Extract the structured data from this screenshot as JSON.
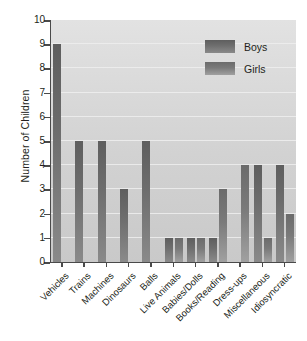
{
  "chart_data": {
    "type": "bar",
    "title": "",
    "xlabel": "",
    "ylabel": "Number of Children",
    "ylim": [
      0,
      10
    ],
    "yticks": [
      0,
      1,
      2,
      3,
      4,
      5,
      6,
      7,
      8,
      9,
      10
    ],
    "grid": true,
    "legend_position": "top-right",
    "categories": [
      "Vehicles",
      "Trains",
      "Machines",
      "Dinosaurs",
      "Balls",
      "Live Animals",
      "Babies/Dolls",
      "Books/Reading",
      "Dress-ups",
      "Miscellaneous",
      "Idiosyncratic"
    ],
    "series": [
      {
        "name": "Boys",
        "values": [
          9,
          5,
          5,
          3,
          5,
          1,
          1,
          1,
          0,
          4,
          4
        ]
      },
      {
        "name": "Girls",
        "values": [
          0,
          0,
          0,
          0,
          0,
          1,
          1,
          3,
          4,
          1,
          2
        ]
      }
    ],
    "colors": {
      "boys": "#6d6d6d",
      "girls": "#7a7a7a",
      "plot_background": "#d5d5d5",
      "gridline": "#efefef",
      "axis": "#4a4a4a",
      "text": "#231f20"
    }
  },
  "legend": {
    "items": [
      {
        "label": "Boys"
      },
      {
        "label": "Girls"
      }
    ]
  }
}
